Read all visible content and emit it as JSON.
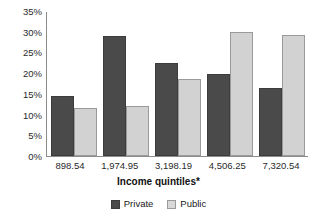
{
  "chart_data": {
    "type": "bar",
    "title": "",
    "xlabel": "Income quintiles*",
    "ylabel": "",
    "ylim": [
      0,
      35
    ],
    "ytick_labels": [
      "35%",
      "30%",
      "25%",
      "20%",
      "15%",
      "10%",
      "5%",
      "0%"
    ],
    "ytick_values": [
      35,
      30,
      25,
      20,
      15,
      10,
      5,
      0
    ],
    "grid": false,
    "legend_position": "bottom-center",
    "categories": [
      "898.54",
      "1,974.95",
      "3,198.19",
      "4,506.25",
      "7,320.54"
    ],
    "series": [
      {
        "name": "Private",
        "color": "#4a4a4a",
        "values": [
          14.5,
          29.0,
          22.5,
          19.7,
          16.3
        ]
      },
      {
        "name": "Public",
        "color": "#d2d2d2",
        "values": [
          11.6,
          12.1,
          18.5,
          30.0,
          29.3
        ]
      }
    ]
  },
  "legend": {
    "items": [
      {
        "label": "Private",
        "variant": "private"
      },
      {
        "label": "Public",
        "variant": "public"
      }
    ]
  },
  "colors": {
    "private": "#4a4a4a",
    "public": "#d2d2d2",
    "axis": "#8c8c8c",
    "text": "#1a1a1a",
    "background": "#ffffff"
  }
}
